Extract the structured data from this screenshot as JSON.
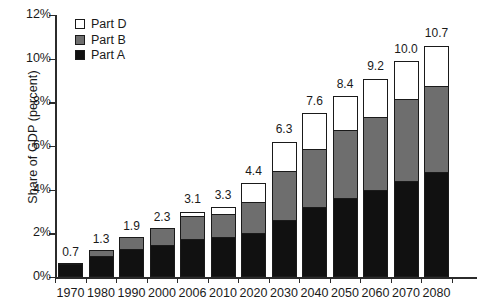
{
  "chart_data": {
    "type": "bar",
    "subtype": "stacked-bar",
    "title": "",
    "xlabel": "",
    "ylabel": "Share of GDP (percent)",
    "ylim": [
      0,
      12
    ],
    "ytick_labels": [
      "0%",
      "2%",
      "4%",
      "6%",
      "8%",
      "10%",
      "12%"
    ],
    "ytick_values": [
      0,
      2,
      4,
      6,
      8,
      10,
      12
    ],
    "grid": false,
    "legend_position": "top-left",
    "categories": [
      "1970",
      "1980",
      "1990",
      "2000",
      "2006",
      "2010",
      "2020",
      "2030",
      "2040",
      "2050",
      "2060",
      "2070",
      "2080"
    ],
    "series": [
      {
        "name": "Part A",
        "color": "#111111",
        "values": [
          0.6,
          0.95,
          1.3,
          1.45,
          1.75,
          1.85,
          2.0,
          2.6,
          3.2,
          3.6,
          4.0,
          4.4,
          4.8
        ]
      },
      {
        "name": "Part B",
        "color": "#6e6e6e",
        "values": [
          0.1,
          0.35,
          0.6,
          0.85,
          1.1,
          1.1,
          1.5,
          2.3,
          2.7,
          3.2,
          3.4,
          3.8,
          4.0
        ]
      },
      {
        "name": "Part D",
        "color": "#ffffff",
        "values": [
          0.0,
          0.0,
          0.0,
          0.0,
          0.25,
          0.35,
          0.9,
          1.4,
          1.7,
          1.6,
          1.8,
          1.8,
          1.9
        ]
      }
    ],
    "totals": [
      0.7,
      1.3,
      1.9,
      2.3,
      3.1,
      3.3,
      4.4,
      6.3,
      7.6,
      8.4,
      9.2,
      10.0,
      10.7
    ],
    "total_labels": [
      "0.7",
      "1.3",
      "1.9",
      "2.3",
      "3.1",
      "3.3",
      "4.4",
      "6.3",
      "7.6",
      "8.4",
      "9.2",
      "10.0",
      "10.7"
    ]
  },
  "legend": {
    "items": [
      {
        "label": "Part D",
        "color": "#ffffff"
      },
      {
        "label": "Part B",
        "color": "#6e6e6e"
      },
      {
        "label": "Part A",
        "color": "#111111"
      }
    ]
  }
}
